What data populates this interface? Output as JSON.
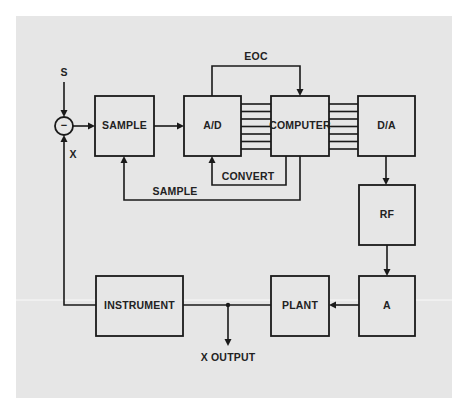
{
  "diagram": {
    "title": "",
    "colors": {
      "background": "#e6e6e6",
      "line": "#1a1a1a",
      "page": "#ffffff"
    },
    "inputs": {
      "setpoint_label": "S",
      "feedback_label": "X"
    },
    "summing_junction": {
      "sign": "−"
    },
    "blocks": {
      "sample": "SAMPLE",
      "ad": "A/D",
      "computer": "COMPUTER",
      "da": "D/A",
      "rf": "RF",
      "a": "A",
      "plant": "PLANT",
      "instrument": "INSTRUMENT"
    },
    "signals": {
      "eoc": "EOC",
      "convert": "CONVERT",
      "sample": "SAMPLE",
      "output": "X OUTPUT"
    },
    "bus_lines": {
      "ad_to_computer": 7,
      "computer_to_da": 7
    },
    "connections": [
      {
        "from": "S",
        "to": "summing_junction"
      },
      {
        "from": "summing_junction",
        "to": "SAMPLE"
      },
      {
        "from": "SAMPLE",
        "to": "A/D"
      },
      {
        "from": "A/D",
        "to": "COMPUTER",
        "type": "bus"
      },
      {
        "from": "A/D",
        "to": "COMPUTER",
        "label": "EOC"
      },
      {
        "from": "COMPUTER",
        "to": "A/D",
        "label": "CONVERT"
      },
      {
        "from": "COMPUTER",
        "to": "SAMPLE",
        "label": "SAMPLE"
      },
      {
        "from": "COMPUTER",
        "to": "D/A",
        "type": "bus"
      },
      {
        "from": "D/A",
        "to": "RF"
      },
      {
        "from": "RF",
        "to": "A"
      },
      {
        "from": "A",
        "to": "PLANT"
      },
      {
        "from": "PLANT",
        "to": "X OUTPUT"
      },
      {
        "from": "PLANT",
        "to": "INSTRUMENT"
      },
      {
        "from": "INSTRUMENT",
        "to": "summing_junction",
        "label": "X"
      }
    ]
  }
}
